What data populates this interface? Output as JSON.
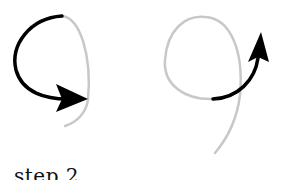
{
  "figure": {
    "caption": "step 2",
    "colors": {
      "background": "#ffffff",
      "guide_stroke": "#c8c8c8",
      "arrow_stroke": "#000000"
    },
    "panels": [
      {
        "id": "left",
        "description": "Digit 9 guide with arrow tracing the loop counter-clockwise",
        "guide_path": "M62 16 C 80 18, 92 55, 88 100 C 86 112, 78 122, 65 126",
        "arrow_path": "M62 16 C 30 18, 10 45, 16 70 C 22 92, 45 100, 72 99",
        "arrow_head": "M88 99 L 56 84 L 62 99 L 56 112 Z"
      },
      {
        "id": "right",
        "description": "Digit 9 guide with arrow tracing the stem upward",
        "guide_path": "M213 99 C 185 100, 163 85, 165 60 C 167 30, 185 15, 205 17 C 230 18, 244 50, 240 95 C 237 120, 226 140, 215 153",
        "arrow_path": "M213 99 C 238 98, 255 80, 258 58",
        "arrow_head": "M261 32 L 248 62 L 258 57 L 269 62 Z"
      }
    ]
  }
}
